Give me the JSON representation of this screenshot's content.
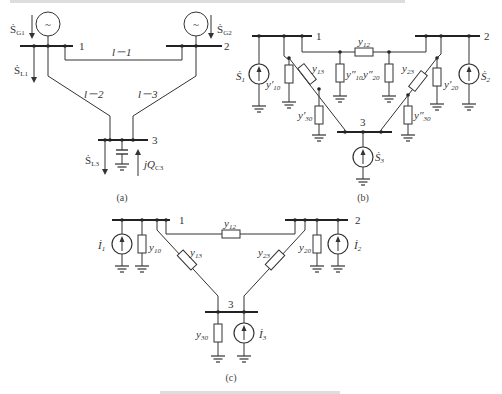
{
  "header_text_faint": "",
  "diagram_a": {
    "caption": "(a)",
    "buses": {
      "b1": "1",
      "b2": "2",
      "b3": "3"
    },
    "lines": {
      "l1": "l－1",
      "l2": "l－2",
      "l3": "l－3"
    },
    "labels": {
      "sg1_main": "Ṡ",
      "sg1_sub": "G1",
      "sg2_main": "Ṡ",
      "sg2_sub": "G2",
      "sl1_main": "Ṡ",
      "sl1_sub": "L1",
      "sl3_main": "Ṡ",
      "sl3_sub": "L3",
      "jqc3_main": "jQ",
      "jqc3_sub": "C3"
    },
    "generator_symbol": "~"
  },
  "diagram_b": {
    "caption": "(b)",
    "buses": {
      "b1": "1",
      "b2": "2",
      "b3": "3"
    },
    "labels": {
      "y12": "y",
      "y12_sub": "12",
      "y13": "y",
      "y13_sub": "13",
      "y23": "y",
      "y23_sub": "23",
      "y10p": "y′",
      "y10p_sub": "10",
      "y10pp": "y″",
      "y10pp_sub": "10",
      "y20p": "y′",
      "y20p_sub": "20",
      "y20pp": "y″",
      "y20pp_sub": "20",
      "y30p": "y′",
      "y30p_sub": "30",
      "y30pp": "y″",
      "y30pp_sub": "30",
      "s1": "Ṡ",
      "s1_sub": "1",
      "s2": "Ṡ",
      "s2_sub": "2",
      "s3": "Ṡ",
      "s3_sub": "3"
    }
  },
  "diagram_c": {
    "caption": "(c)",
    "buses": {
      "b1": "1",
      "b2": "2",
      "b3": "3"
    },
    "labels": {
      "y12": "y",
      "y12_sub": "12",
      "y13": "y",
      "y13_sub": "13",
      "y23": "y",
      "y23_sub": "23",
      "y10": "y",
      "y10_sub": "10",
      "y20": "y",
      "y20_sub": "20",
      "y30": "y",
      "y30_sub": "30",
      "i1": "İ",
      "i1_sub": "1",
      "i2": "İ",
      "i2_sub": "2",
      "i3": "İ",
      "i3_sub": "3"
    }
  },
  "figure_caption_faint": ""
}
